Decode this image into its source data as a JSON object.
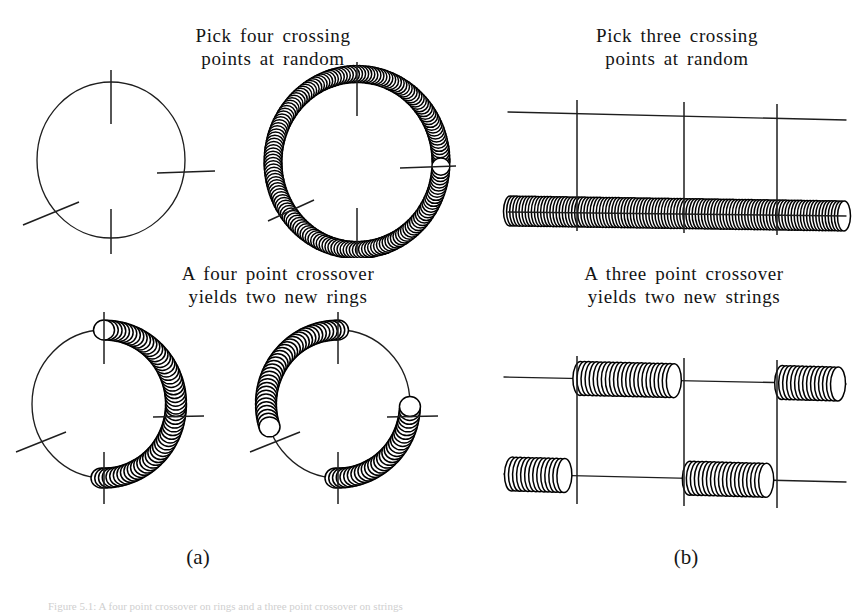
{
  "figure": {
    "panel_a": {
      "label": "(a)",
      "top_caption": "Pick  four  crossing\npoints  at  random",
      "bottom_caption": "A  four point  crossover\nyields  two new  rings",
      "crossing_points": 4,
      "result_count": 2,
      "result_kind": "rings",
      "top_left_diagram": "thin-ring-with-four-crossing-ticks",
      "top_right_diagram": "thick-beaded-ring-with-four-crossing-ticks",
      "bottom_left_diagram": "ring-offspring-one",
      "bottom_right_diagram": "ring-offspring-two"
    },
    "panel_b": {
      "label": "(b)",
      "top_caption": "Pick  three  crossing\npoints  at  random",
      "bottom_caption": "A  three point  crossover\nyields  two new  strings",
      "crossing_points": 3,
      "result_count": 2,
      "result_kind": "strings",
      "top_diagram": "thin-string-and-thick-beaded-string-with-three-crossing-verticals",
      "bottom_diagram": "two-recombined-strings-with-three-crossing-verticals"
    },
    "bottom_caption_faint": "Figure 5.1:  A four point crossover on rings and a three point crossover on strings",
    "colors": {
      "ink": "#1e1e1e",
      "bead_fill": "#ffffff",
      "bead_stroke": "#000000",
      "background": "#ffffff",
      "faint_caption": "#cfcfcf"
    }
  },
  "chart_data": {
    "type": "diagram",
    "panels": [
      {
        "id": "a",
        "label": "(a)",
        "topology": "ring",
        "crossing_points": 4,
        "crossing_angles_deg": [
          90,
          0,
          200,
          270
        ],
        "parents": [
          {
            "name": "parent-1",
            "style": "thin-line-ring"
          },
          {
            "name": "parent-2",
            "style": "thick-beaded-ring"
          }
        ],
        "offspring": [
          {
            "name": "child-1",
            "thick_arcs_deg": [
              [
                268,
                360
              ],
              [
                0,
                90
              ]
            ],
            "thin_arcs_deg": [
              [
                90,
                200
              ],
              [
                200,
                268
              ]
            ]
          },
          {
            "name": "child-2",
            "thick_arcs_deg": [
              [
                90,
                200
              ],
              [
                268,
                360
              ]
            ],
            "thin_arcs_deg": [
              [
                0,
                90
              ],
              [
                200,
                268
              ]
            ]
          }
        ]
      },
      {
        "id": "b",
        "label": "(b)",
        "topology": "string",
        "crossing_points": 3,
        "crossing_x_fractions": [
          0.2,
          0.52,
          0.79
        ],
        "parents": [
          {
            "name": "parent-1",
            "style": "thin-line-string"
          },
          {
            "name": "parent-2",
            "style": "thick-beaded-string"
          }
        ],
        "offspring": [
          {
            "name": "child-1",
            "thick_segments": [
              [
                0.2,
                0.52
              ],
              [
                0.79,
                1.0
              ]
            ]
          },
          {
            "name": "child-2",
            "thick_segments": [
              [
                0.0,
                0.2
              ],
              [
                0.52,
                0.79
              ]
            ]
          }
        ]
      }
    ]
  }
}
